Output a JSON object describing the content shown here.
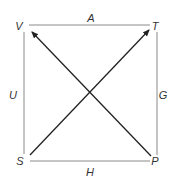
{
  "diagram": {
    "type": "square-with-diagonal-arrows",
    "vertices": [
      {
        "id": "V",
        "label": "V",
        "position": "top-left"
      },
      {
        "id": "T",
        "label": "T",
        "position": "top-right"
      },
      {
        "id": "S",
        "label": "S",
        "position": "bottom-left"
      },
      {
        "id": "P",
        "label": "P",
        "position": "bottom-right"
      }
    ],
    "edges": [
      {
        "from": "V",
        "to": "T",
        "label": "A",
        "side": "top"
      },
      {
        "from": "T",
        "to": "P",
        "label": "G",
        "side": "right"
      },
      {
        "from": "S",
        "to": "P",
        "label": "H",
        "side": "bottom"
      },
      {
        "from": "V",
        "to": "S",
        "label": "U",
        "side": "left"
      }
    ],
    "arrows": [
      {
        "from": "P",
        "to": "V",
        "directed": true
      },
      {
        "from": "S",
        "to": "T",
        "directed": true
      }
    ],
    "colors": {
      "square_edge": "#8a8a8a",
      "arrow": "#222222",
      "label": "#333333"
    }
  }
}
